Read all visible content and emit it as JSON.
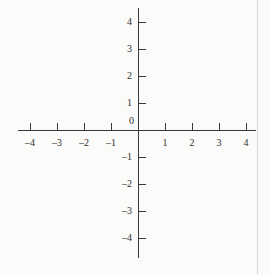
{
  "figure": {
    "name": "cartesian-coordinate-plane",
    "background_color": "#fbfbfa",
    "ink_color": "#3a3a3a",
    "width": 269,
    "height": 275
  },
  "origin_label": "0",
  "chart_data": {
    "type": "scatter",
    "title": "",
    "subtitle": "",
    "xlabel": "",
    "ylabel": "",
    "xlim": [
      -4.4,
      4.4
    ],
    "ylim": [
      -4.7,
      4.5
    ],
    "x_ticks": [
      -4,
      -3,
      -2,
      -1,
      1,
      2,
      3,
      4
    ],
    "y_ticks": [
      4,
      3,
      2,
      1,
      -1,
      -2,
      -3,
      -4
    ],
    "x_tick_labels": [
      "–4",
      "–3",
      "–2",
      "–1",
      "1",
      "2",
      "3",
      "4"
    ],
    "y_tick_labels": [
      "4",
      "3",
      "2",
      "1",
      "–1",
      "–2",
      "–3",
      "–4"
    ],
    "origin_label": "0",
    "grid": false,
    "legend": null,
    "series": [],
    "annotations": []
  },
  "geometry": {
    "origin_x": 138,
    "origin_y": 130,
    "unit_px": 27,
    "x_axis_start": 18,
    "x_axis_end": 256,
    "y_axis_start": 8,
    "y_axis_end": 258,
    "tick_len": 7,
    "scan_edge_x": 257
  }
}
